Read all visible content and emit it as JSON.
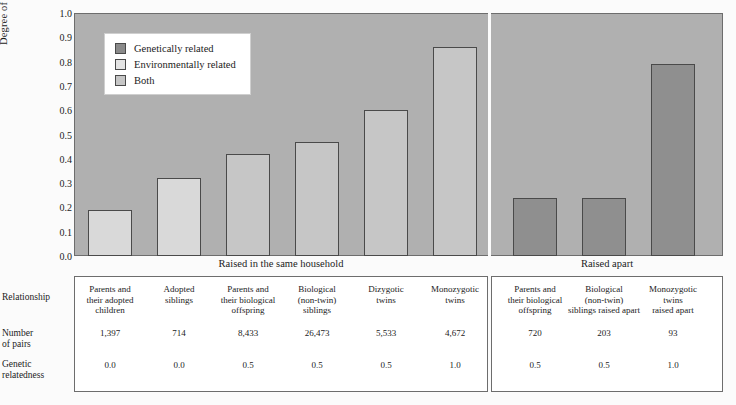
{
  "chart_data": {
    "type": "bar",
    "title": "",
    "xlabel": "",
    "ylabel": "Degree of resemblance",
    "ylim": [
      0.0,
      1.0
    ],
    "ytick_labels": [
      "1.0",
      "0.9",
      "0.8",
      "0.7",
      "0.6",
      "0.5",
      "0.4",
      "0.3",
      "0.2",
      "0.1",
      "0.0"
    ],
    "ytick_values": [
      1.0,
      0.9,
      0.8,
      0.7,
      0.6,
      0.5,
      0.4,
      0.3,
      0.2,
      0.1,
      0.0
    ],
    "grid": false,
    "legend_position": "top-left",
    "legend": [
      {
        "label": "Genetically related",
        "key": "genetic",
        "color": "#8a8a8a"
      },
      {
        "label": "Environmentally related",
        "key": "environmental",
        "color": "#e4e4e4"
      },
      {
        "label": "Both",
        "key": "both",
        "color": "#c6c6c6"
      }
    ],
    "groups": [
      {
        "name": "Raised in the same household",
        "count": 6
      },
      {
        "name": "Raised apart",
        "count": 3
      }
    ],
    "categories": [
      "Parents and their adopted children",
      "Adopted siblings",
      "Parents and their biological offspring",
      "Biological (non-twin) siblings",
      "Dizygotic twins",
      "Monozygotic twins",
      "Parents and their biological offspring",
      "Biological (non-twin) siblings raised apart",
      "Monozygotic twins raised apart"
    ],
    "values": [
      0.19,
      0.32,
      0.42,
      0.47,
      0.6,
      0.86,
      0.24,
      0.24,
      0.79
    ],
    "bar_series_keys": [
      "environmental",
      "environmental",
      "both",
      "both",
      "both",
      "both",
      "genetic",
      "genetic",
      "genetic"
    ]
  },
  "axis": {
    "y_title": "Degree of resemblance"
  },
  "captions": {
    "household": "Raised in the same household",
    "apart": "Raised apart"
  },
  "table": {
    "row_labels": {
      "relationship": "Relationship",
      "pairs_line1": "Number",
      "pairs_line2": "of pairs",
      "genetic_line1": "Genetic",
      "genetic_line2": "relatedness"
    },
    "columns": [
      {
        "relationship": [
          "Parents and",
          "their adopted",
          "children"
        ],
        "pairs": "1,397",
        "genetic": "0.0"
      },
      {
        "relationship": [
          "Adopted",
          "siblings"
        ],
        "pairs": "714",
        "genetic": "0.0"
      },
      {
        "relationship": [
          "Parents and",
          "their biological",
          "offspring"
        ],
        "pairs": "8,433",
        "genetic": "0.5"
      },
      {
        "relationship": [
          "Biological",
          "(non-twin)",
          "siblings"
        ],
        "pairs": "26,473",
        "genetic": "0.5"
      },
      {
        "relationship": [
          "Dizygotic",
          "twins"
        ],
        "pairs": "5,533",
        "genetic": "0.5"
      },
      {
        "relationship": [
          "Monozygotic",
          "twins"
        ],
        "pairs": "4,672",
        "genetic": "1.0"
      },
      {
        "relationship": [
          "Parents and",
          "their biological",
          "offspring"
        ],
        "pairs": "720",
        "genetic": "0.5"
      },
      {
        "relationship": [
          "Biological",
          "(non-twin)",
          "siblings raised apart"
        ],
        "pairs": "203",
        "genetic": "0.5"
      },
      {
        "relationship": [
          "Monozygotic",
          "twins",
          "raised apart"
        ],
        "pairs": "93",
        "genetic": "1.0"
      }
    ]
  }
}
